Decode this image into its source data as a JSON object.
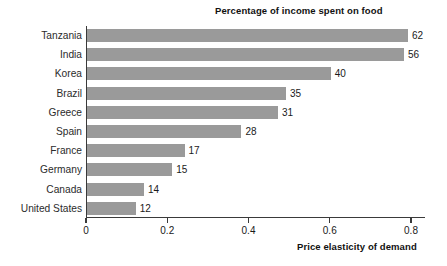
{
  "chart_data": {
    "type": "bar",
    "orientation": "horizontal",
    "title": "",
    "series_title": "Percentage of income spent on food",
    "xlabel": "Price elasticity of demand",
    "ylabel": "",
    "xlim": [
      0,
      0.86
    ],
    "x_ticks": [
      0,
      0.2,
      0.4,
      0.6,
      0.8
    ],
    "x_tick_labels": [
      "0",
      "0.2",
      "0.4",
      "0.6",
      "0.8"
    ],
    "grid": false,
    "legend": "none",
    "bar_color": "#9a9a9a",
    "axis_color": "#3a3a3a",
    "categories": [
      "Tanzania",
      "India",
      "Korea",
      "Brazil",
      "Greece",
      "Spain",
      "France",
      "Germany",
      "Canada",
      "United States"
    ],
    "values": [
      0.79,
      0.78,
      0.6,
      0.49,
      0.47,
      0.38,
      0.24,
      0.21,
      0.14,
      0.12
    ],
    "data_labels": [
      "62",
      "56",
      "40",
      "35",
      "31",
      "28",
      "17",
      "15",
      "14",
      "12"
    ],
    "points": [
      {
        "category": "Tanzania",
        "price_elasticity_of_demand": 0.79,
        "percentage_of_income_spent_on_food": 62
      },
      {
        "category": "India",
        "price_elasticity_of_demand": 0.78,
        "percentage_of_income_spent_on_food": 56
      },
      {
        "category": "Korea",
        "price_elasticity_of_demand": 0.6,
        "percentage_of_income_spent_on_food": 40
      },
      {
        "category": "Brazil",
        "price_elasticity_of_demand": 0.49,
        "percentage_of_income_spent_on_food": 35
      },
      {
        "category": "Greece",
        "price_elasticity_of_demand": 0.47,
        "percentage_of_income_spent_on_food": 31
      },
      {
        "category": "Spain",
        "price_elasticity_of_demand": 0.38,
        "percentage_of_income_spent_on_food": 28
      },
      {
        "category": "France",
        "price_elasticity_of_demand": 0.24,
        "percentage_of_income_spent_on_food": 17
      },
      {
        "category": "Germany",
        "price_elasticity_of_demand": 0.21,
        "percentage_of_income_spent_on_food": 15
      },
      {
        "category": "Canada",
        "price_elasticity_of_demand": 0.14,
        "percentage_of_income_spent_on_food": 14
      },
      {
        "category": "United States",
        "price_elasticity_of_demand": 0.12,
        "percentage_of_income_spent_on_food": 12
      }
    ]
  }
}
